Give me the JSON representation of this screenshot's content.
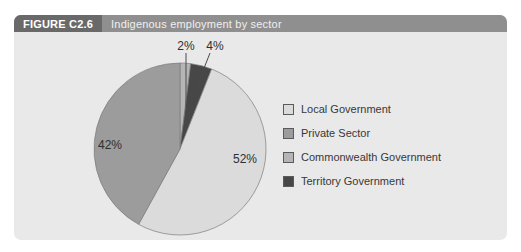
{
  "figure": {
    "label": "FIGURE C2.6",
    "title": "Indigenous employment by sector"
  },
  "colors": {
    "panel_bg": "#e9e9e9",
    "header_bar_bg": "#8f8f8f",
    "header_label_bg": "#696969",
    "pie_outline": "#7d7d7d",
    "leader_line": "#4a4a4a"
  },
  "chart_data": {
    "type": "pie",
    "title": "Indigenous employment by sector",
    "categories": [
      "Local Government",
      "Private Sector",
      "Commonwealth Government",
      "Territory Government"
    ],
    "values": [
      52,
      42,
      2,
      4
    ],
    "start_angle_deg": 0,
    "direction": "clockwise",
    "legend_position": "right",
    "slices": [
      {
        "label": "Commonwealth Government",
        "value": 2,
        "pct_label": "2%",
        "color": "#b5b5b5"
      },
      {
        "label": "Territory Government",
        "value": 4,
        "pct_label": "4%",
        "color": "#474747"
      },
      {
        "label": "Local Government",
        "value": 52,
        "pct_label": "52%",
        "color": "#dbdbdb"
      },
      {
        "label": "Private Sector",
        "value": 42,
        "pct_label": "42%",
        "color": "#9c9c9c"
      }
    ],
    "legend": [
      {
        "label": "Local Government",
        "color": "#dbdbdb"
      },
      {
        "label": "Private Sector",
        "color": "#9c9c9c"
      },
      {
        "label": "Commonwealth Government",
        "color": "#b5b5b5"
      },
      {
        "label": "Territory Government",
        "color": "#474747"
      }
    ]
  }
}
